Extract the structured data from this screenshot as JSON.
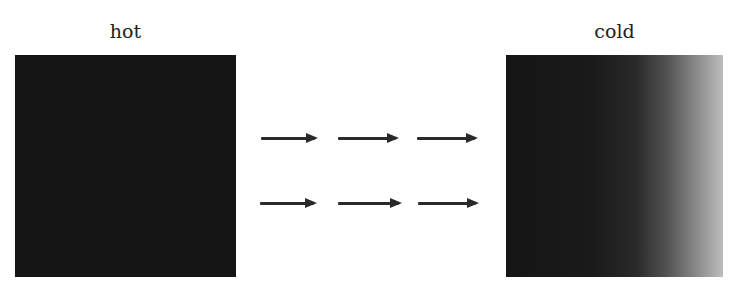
{
  "diagram": {
    "left": {
      "label": "hot",
      "fill": "#141414"
    },
    "right": {
      "label": "cold",
      "fill_gradient": [
        "#151515",
        "#bdbdbd"
      ]
    },
    "arrows": {
      "direction": "right",
      "rows": 2,
      "per_row": 3,
      "color": "#2a2a2a"
    }
  }
}
